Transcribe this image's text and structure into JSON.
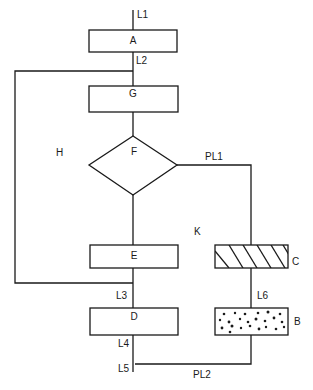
{
  "diagram": {
    "type": "flow-diagram",
    "nodes": [
      {
        "id": "A",
        "label": "A",
        "shape": "rectangle",
        "fill": "plain"
      },
      {
        "id": "G",
        "label": "G",
        "shape": "rectangle",
        "fill": "plain"
      },
      {
        "id": "F",
        "label": "F",
        "shape": "diamond",
        "fill": "plain"
      },
      {
        "id": "E",
        "label": "E",
        "shape": "rectangle",
        "fill": "plain"
      },
      {
        "id": "D",
        "label": "D",
        "shape": "rectangle",
        "fill": "plain"
      },
      {
        "id": "C",
        "label": "C",
        "shape": "rectangle",
        "fill": "diagonal-hatch"
      },
      {
        "id": "B",
        "label": "B",
        "shape": "rectangle",
        "fill": "stippled"
      }
    ],
    "line_labels": {
      "L1": "L1",
      "L2": "L2",
      "L3": "L3",
      "L4": "L4",
      "L5": "L5",
      "L6": "L6",
      "PL1": "PL1",
      "PL2": "PL2"
    },
    "region_labels": {
      "H": "H",
      "K": "K"
    },
    "edges": [
      {
        "from": "L1",
        "to": "A"
      },
      {
        "from": "A",
        "to": "G",
        "via": "L2"
      },
      {
        "from": "L2",
        "to": "L3",
        "via": "H",
        "note": "bypass loop on left"
      },
      {
        "from": "G",
        "to": "F"
      },
      {
        "from": "F",
        "to": "E"
      },
      {
        "from": "F",
        "to": "C",
        "via": "PL1"
      },
      {
        "from": "E",
        "to": "D",
        "via": "L3"
      },
      {
        "from": "C",
        "to": "B",
        "via": "L6"
      },
      {
        "from": "D",
        "to": "L5",
        "via": "L4"
      },
      {
        "from": "B",
        "to": "L5",
        "via": "PL2"
      }
    ],
    "colors": {
      "stroke": "#1a1a1a",
      "background": "#ffffff"
    }
  }
}
